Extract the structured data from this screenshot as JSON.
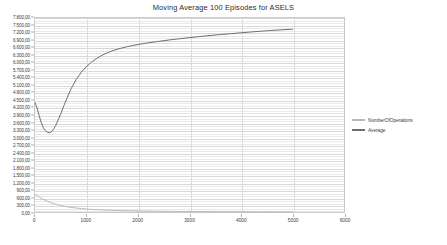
{
  "chart_data": {
    "type": "line",
    "title": "Moving Average 100 Episodes for ASELS",
    "xlabel": "",
    "ylabel": "",
    "xlim": [
      0,
      6000
    ],
    "ylim": [
      0,
      7800
    ],
    "grid": true,
    "legend_position": "right",
    "x_ticks": [
      0,
      1000,
      2000,
      3000,
      4000,
      5000,
      6000
    ],
    "x_tick_labels": [
      "0",
      "1000",
      "2000",
      "3000",
      "4000",
      "5000",
      "6000"
    ],
    "y_ticks": [
      0,
      300,
      600,
      900,
      1200,
      1500,
      1800,
      2100,
      2400,
      2700,
      3000,
      3300,
      3600,
      3900,
      4200,
      4500,
      4800,
      5100,
      5400,
      5700,
      6000,
      6300,
      6600,
      6900,
      7200,
      7500,
      7800
    ],
    "y_tick_labels": [
      "0,00",
      "300,00",
      "600,00",
      "900,00",
      "1.200,00",
      "1.500,00",
      "1.800,00",
      "2.100,00",
      "2.400,00",
      "2.700,00",
      "3.000,00",
      "3.300,00",
      "3.600,00",
      "3.900,00",
      "4.200,00",
      "4.500,00",
      "4.800,00",
      "5.100,00",
      "5.400,00",
      "5.700,00",
      "6.000,00",
      "6.300,00",
      "6.600,00",
      "6.900,00",
      "7.200,00",
      "7.500,00",
      "7.800,00"
    ],
    "series": [
      {
        "name": "NumberOfOperations",
        "color": "#b9b9b9",
        "x": [
          0,
          50,
          100,
          150,
          200,
          250,
          300,
          350,
          400,
          450,
          500,
          600,
          700,
          800,
          900,
          1000,
          1100,
          1200,
          1400,
          1600,
          1800,
          2000,
          2400,
          2800,
          3200,
          3600,
          4000,
          4400,
          4800,
          5000
        ],
        "values": [
          700,
          640,
          580,
          520,
          470,
          425,
          385,
          350,
          318,
          290,
          265,
          222,
          188,
          160,
          138,
          120,
          105,
          92,
          74,
          60,
          50,
          42,
          30,
          22,
          17,
          13,
          10,
          8,
          6,
          5
        ]
      },
      {
        "name": "Average",
        "color": "#6e6e6e",
        "x": [
          0,
          40,
          80,
          120,
          160,
          200,
          240,
          280,
          320,
          360,
          400,
          450,
          500,
          560,
          620,
          700,
          800,
          900,
          1000,
          1100,
          1200,
          1300,
          1400,
          1500,
          1600,
          1700,
          1800,
          1900,
          2000,
          2200,
          2400,
          2600,
          2800,
          3000,
          3200,
          3400,
          3600,
          3800,
          4000,
          4200,
          4400,
          4600,
          4800,
          5000
        ],
        "values": [
          4400,
          4180,
          3880,
          3600,
          3400,
          3270,
          3205,
          3190,
          3230,
          3330,
          3470,
          3700,
          3950,
          4270,
          4570,
          4950,
          5330,
          5620,
          5850,
          6030,
          6180,
          6300,
          6400,
          6480,
          6545,
          6600,
          6650,
          6695,
          6735,
          6800,
          6860,
          6915,
          6965,
          7010,
          7055,
          7095,
          7135,
          7170,
          7205,
          7240,
          7270,
          7300,
          7325,
          7350
        ]
      }
    ]
  },
  "legend": {
    "items": [
      {
        "label": "NumberOfOperations",
        "color": "#b9b9b9"
      },
      {
        "label": "Average",
        "color": "#6e6e6e"
      }
    ]
  }
}
